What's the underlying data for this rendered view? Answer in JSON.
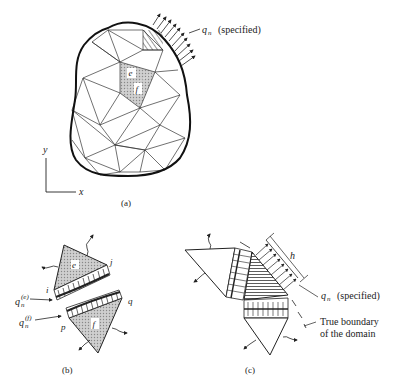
{
  "figure": {
    "panel_a": {
      "caption": "(a)",
      "load_label_q": "q",
      "load_label_sub": "n",
      "load_label_note": "(specified)",
      "element_e": "e",
      "element_f": "f",
      "axis_x": "x",
      "axis_y": "y"
    },
    "panel_b": {
      "caption": "(b)",
      "element_e": "e",
      "element_f": "f",
      "node_i": "i",
      "node_j": "j",
      "node_p": "p",
      "node_q": "q",
      "flux_e_q": "q",
      "flux_e_sub": "n",
      "flux_e_sup": "(e)",
      "flux_f_q": "q",
      "flux_f_sub": "n",
      "flux_f_sup": "(f)"
    },
    "panel_c": {
      "caption": "(c)",
      "dimension_h": "h",
      "load_label_q": "q",
      "load_label_sub": "n",
      "load_label_note": "(specified)",
      "boundary_line1": "True boundary",
      "boundary_line2": "of the domain"
    }
  },
  "colors": {
    "ink": "#222222",
    "shade": "#bdbdbd",
    "background": "#ffffff"
  }
}
